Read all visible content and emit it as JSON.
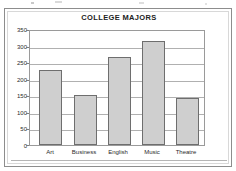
{
  "figure": {
    "frame_color": "#8d8d8d",
    "background": "#ffffff"
  },
  "chart_data": {
    "type": "bar",
    "title": "COLLEGE MAJORS",
    "xlabel": "",
    "ylabel": "",
    "categories": [
      "Art",
      "Business",
      "English",
      "Music",
      "Theatre"
    ],
    "values": [
      230,
      155,
      270,
      320,
      145
    ],
    "series": [
      {
        "name": "Number of Majors",
        "values": [
          230,
          155,
          270,
          320,
          145
        ]
      }
    ],
    "ylim": [
      0,
      350
    ],
    "ytick_labels": [
      "0",
      "50",
      "100",
      "150",
      "200",
      "250",
      "300",
      "350"
    ],
    "ytick_values": [
      0,
      50,
      100,
      150,
      200,
      250,
      300,
      350
    ],
    "ytick_step": 50,
    "grid": true,
    "grid_axis": "y",
    "legend": false,
    "legend_position": "none",
    "bar_fill_color": "#cfcfcf",
    "bar_edge_color": "#6e6e6e",
    "gridline_color": "#b0b0b0",
    "axis_color": "#9a9a9a",
    "title_color": "#222222",
    "tick_label_color": "#2b2b2b"
  }
}
